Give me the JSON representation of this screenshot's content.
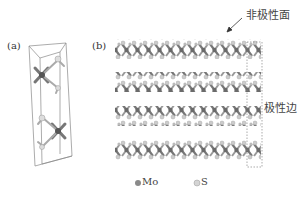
{
  "figure": {
    "panel_a": {
      "label": "(a)",
      "description": "MoS2 unit cell, two S-Mo-S layers in a box"
    },
    "panel_b": {
      "label": "(b)",
      "description": "Four stacked MoS2 layers, side view",
      "layer_count": 4,
      "annotations": {
        "basal_plane": "非极性面",
        "edge": "极性边"
      }
    },
    "legend": [
      {
        "label": "Mo",
        "color": "#8a8a8a"
      },
      {
        "label": "S",
        "color": "#d4d4d4"
      }
    ]
  }
}
